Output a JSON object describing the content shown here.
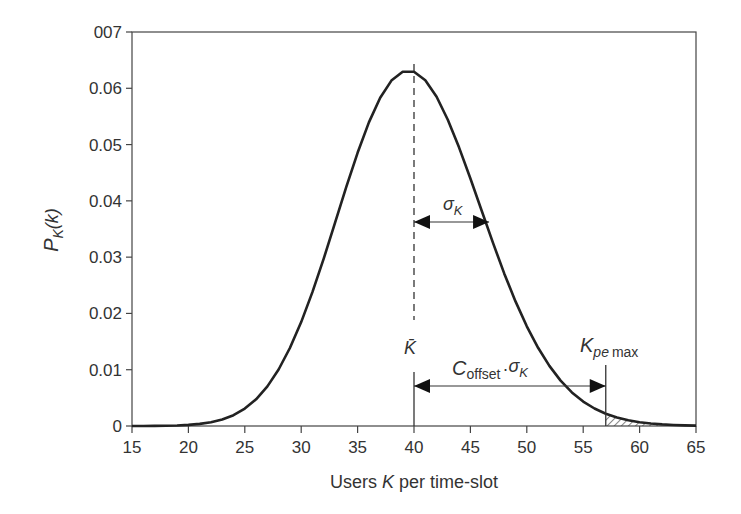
{
  "chart_data": {
    "type": "line",
    "title": "",
    "xlabel": "Users K per time-slot",
    "ylabel": "P_K(k)",
    "xlim": [
      15,
      65
    ],
    "ylim": [
      0,
      0.07
    ],
    "grid": false,
    "legend": null,
    "x_ticks": [
      "15",
      "20",
      "25",
      "30",
      "35",
      "40",
      "45",
      "50",
      "55",
      "60",
      "65"
    ],
    "y_ticks": [
      "0",
      "0.01",
      "0.02",
      "0.03",
      "0.04",
      "0.05",
      "0.06",
      "007"
    ],
    "series": [
      {
        "name": "P_K(k)",
        "x": [
          15,
          16,
          17,
          18,
          19,
          20,
          21,
          22,
          23,
          24,
          25,
          26,
          27,
          28,
          29,
          30,
          31,
          32,
          33,
          34,
          35,
          36,
          37,
          38,
          39,
          40,
          41,
          42,
          43,
          44,
          45,
          46,
          47,
          48,
          49,
          50,
          51,
          52,
          53,
          54,
          55,
          56,
          57,
          58,
          59,
          60,
          61,
          62,
          63,
          64,
          65
        ],
        "values": [
          1e-05,
          2e-05,
          5e-05,
          0.0001,
          0.0002,
          0.0004,
          0.0007,
          0.0013,
          0.0022,
          0.0037,
          0.0058,
          0.0089,
          0.0132,
          0.0188,
          0.026,
          0.0343,
          0.0434,
          0.053,
          0.0615,
          0.0681,
          0.0485,
          0.0539,
          0.0583,
          0.0614,
          0.0629,
          0.0629,
          0.0614,
          0.0585,
          0.0544,
          0.0495,
          0.044,
          0.0382,
          0.0325,
          0.0271,
          0.0221,
          0.0177,
          0.0139,
          0.0107,
          0.0081,
          0.006,
          0.0043,
          0.0031,
          0.0022,
          0.0015,
          0.001,
          0.0007,
          0.0004,
          0.0003,
          0.0002,
          0.0001,
          5e-05
        ]
      }
    ],
    "annotations": {
      "mean_label": "K̄",
      "mean_x": 40,
      "sigma_label": "σ",
      "sigma_sub": "K",
      "sigma_value": 6.3,
      "offset_label_main": "C",
      "offset_label_sub": "offset",
      "offset_label_dot": "·",
      "offset_label_sigma": "σ",
      "offset_label_sigma_sub": "K",
      "kpe_label_main": "K",
      "kpe_label_sub": "pe",
      "kpe_label_max": "max",
      "kpe_x": 57,
      "shaded_region": [
        57,
        62
      ]
    }
  },
  "axes": {
    "x_title_prefix": "Users ",
    "x_title_var": "K",
    "x_title_suffix": " per time-slot",
    "y_title_main": "P",
    "y_title_sub": "K",
    "y_title_arg": "(k)"
  }
}
